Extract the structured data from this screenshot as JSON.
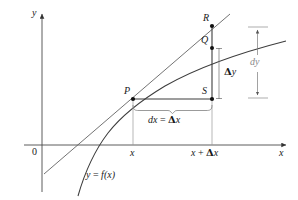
{
  "figure": {
    "type": "math-diagram",
    "axes": {
      "x_axis_label": "x",
      "y_axis_label": "y",
      "origin_label": "0",
      "x_axis_y_px": 145,
      "y_axis_x_px": 42
    },
    "points": [
      {
        "id": "P",
        "label": "P",
        "x_px": 133,
        "y_px": 99
      },
      {
        "id": "Q",
        "label": "Q",
        "x_px": 212,
        "y_px": 48
      },
      {
        "id": "R",
        "label": "R",
        "x_px": 212,
        "y_px": 26
      },
      {
        "id": "S",
        "label": "S",
        "x_px": 212,
        "y_px": 99
      }
    ],
    "tick_labels": [
      {
        "id": "x",
        "text": "x",
        "x_px": 133
      },
      {
        "id": "x-plus-delta-x",
        "text_parts": [
          "x",
          " + ",
          "Δ",
          "x"
        ],
        "x_px": 212
      }
    ],
    "annotations": {
      "curve_label": {
        "lhs": "y",
        "eq": " = ",
        "rhs": "f",
        "arg": "(x)"
      },
      "delta_y": {
        "greek": "Δ",
        "var": "y"
      },
      "dy": {
        "d": "d",
        "var": "y"
      },
      "dx_eq_delta_x": {
        "dx": "dx",
        "eq": " = ",
        "greek": "Δ",
        "var": "x"
      }
    },
    "colors": {
      "ink": "#1a1a1a",
      "line": "#4a4a4a",
      "thin": "#8a8a8a",
      "background": "#ffffff"
    }
  }
}
